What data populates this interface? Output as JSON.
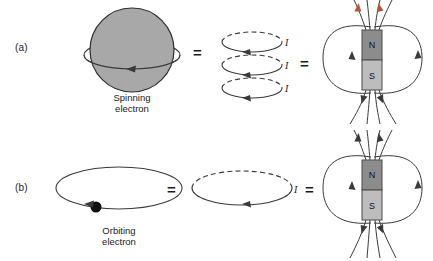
{
  "figure": {
    "background_color": "#ffffff",
    "ink_color": "#3a3a3a"
  },
  "rows": [
    {
      "id": "a",
      "label": "(a)",
      "source": {
        "name": "spinning-electron",
        "caption_line1": "Spinning",
        "caption_line2": "electron",
        "shape": "shaded-sphere-with-equator-arrow",
        "fill_color": "#a8a8a8",
        "rotation_arrow_direction": "leftward"
      },
      "equals_1": "=",
      "loops": {
        "name": "stacked-current-loops",
        "count": 3,
        "current_labels": [
          "I",
          "I",
          "I"
        ],
        "arrow_direction": "rightward",
        "back_half_style": "dashed",
        "front_half_style": "solid"
      },
      "equals_2": "=",
      "magnet": {
        "name": "bar-magnet",
        "north_label": "N",
        "south_label": "S",
        "north_color": "#8c8c8c",
        "south_color": "#bdbdbd",
        "field_line_loops": 2,
        "top_arrow_color": "#b05a3c",
        "top_arrow_count": 2
      }
    },
    {
      "id": "b",
      "label": "(b)",
      "source": {
        "name": "orbiting-electron",
        "caption_line1": "Orbiting",
        "caption_line2": "electron",
        "shape": "ellipse-orbit-with-electron-dot",
        "electron_dot_color": "#111111",
        "rotation_arrow_direction": "leftward"
      },
      "equals_1": "=",
      "loops": {
        "name": "single-current-loop",
        "count": 1,
        "current_labels": [
          "I"
        ],
        "arrow_direction": "rightward",
        "back_half_style": "dashed",
        "front_half_style": "solid"
      },
      "equals_2": "=",
      "magnet": {
        "name": "bar-magnet",
        "north_label": "N",
        "south_label": "S",
        "north_color": "#8c8c8c",
        "south_color": "#bdbdbd",
        "field_line_loops": 2,
        "top_arrow_color": "#3a3a3a",
        "top_arrow_count": 2
      }
    }
  ]
}
